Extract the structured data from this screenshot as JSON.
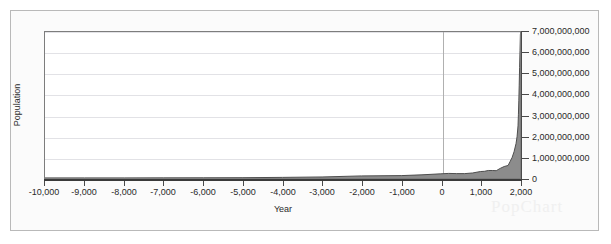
{
  "chart_data": {
    "type": "area",
    "title": "",
    "xlabel": "Year",
    "ylabel": "Population",
    "xlim": [
      -10000,
      2000
    ],
    "ylim": [
      0,
      7000000000
    ],
    "grid": true,
    "legend": null,
    "series_fill_color": "#8c8c8c",
    "series_line_color": "#4d4d4d",
    "gridline_color": "#e2e2e6",
    "axis_color": "#4a4a4a",
    "x_ticks": [
      -10000,
      -9000,
      -8000,
      -7000,
      -6000,
      -5000,
      -4000,
      -3000,
      -2000,
      -1000,
      0,
      1000,
      2000
    ],
    "x_tick_labels": [
      "-10,000",
      "-9,000",
      "-8,000",
      "-7,000",
      "-6,000",
      "-5,000",
      "-4,000",
      "-3,000",
      "-2,000",
      "-1,000",
      "0",
      "1,000",
      "2,000"
    ],
    "y_ticks": [
      0,
      1000000000,
      2000000000,
      3000000000,
      4000000000,
      5000000000,
      6000000000,
      7000000000
    ],
    "y_tick_labels": [
      "0",
      "1,000,000,000",
      "2,000,000,000",
      "3,000,000,000",
      "4,000,000,000",
      "5,000,000,000",
      "6,000,000,000",
      "7,000,000,000"
    ],
    "y_axis_side": "right",
    "vertical_gridline_at": 0,
    "x": [
      -10000,
      -9000,
      -8000,
      -7000,
      -6000,
      -5000,
      -4000,
      -3000,
      -2000,
      -1000,
      -500,
      0,
      200,
      400,
      600,
      800,
      1000,
      1100,
      1200,
      1300,
      1400,
      1500,
      1600,
      1700,
      1750,
      1800,
      1850,
      1900,
      1927,
      1950,
      1960,
      1970,
      1980,
      1990,
      2000,
      2010
    ],
    "values": [
      4000000,
      5000000,
      5000000,
      7000000,
      10000000,
      15000000,
      30000000,
      50000000,
      100000000,
      115000000,
      150000000,
      200000000,
      220000000,
      210000000,
      210000000,
      240000000,
      310000000,
      320000000,
      360000000,
      360000000,
      350000000,
      460000000,
      550000000,
      600000000,
      790000000,
      980000000,
      1260000000,
      1650000000,
      2000000000,
      2500000000,
      3030000000,
      3700000000,
      4450000000,
      5300000000,
      6100000000,
      6900000000
    ]
  },
  "watermark": {
    "text": "PopChart"
  }
}
